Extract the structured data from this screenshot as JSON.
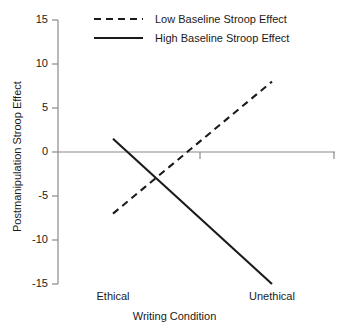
{
  "chart_data": {
    "type": "line",
    "title": "",
    "xlabel": "Writing Condition",
    "ylabel": "Postmanipulation Stroop Effect",
    "categories": [
      "Ethical",
      "Unethical"
    ],
    "x_tick_labels": [
      "Ethical",
      "Unethical"
    ],
    "y_tick_labels": [
      "15",
      "10",
      "5",
      "0",
      "-5",
      "-10",
      "-15"
    ],
    "y_ticks": [
      15,
      10,
      5,
      0,
      -5,
      -10,
      -15
    ],
    "ylim": [
      -15,
      15
    ],
    "grid": false,
    "zero_line": true,
    "legend_position": "top-center",
    "series": [
      {
        "name": "Low Baseline Stroop Effect",
        "style": "dashed",
        "color": "#1a1a1a",
        "values": [
          -7,
          8
        ]
      },
      {
        "name": "High Baseline Stroop Effect",
        "style": "solid",
        "color": "#1a1a1a",
        "values": [
          1.5,
          -15
        ]
      }
    ]
  },
  "axis": {
    "y_labels": {
      "t15": "15",
      "t10": "10",
      "t5": "5",
      "t0": "0",
      "tm5": "-5",
      "tm10": "-10",
      "tm15": "-15"
    },
    "x_labels": {
      "ethical": "Ethical",
      "unethical": "Unethical"
    },
    "x_title": "Writing Condition",
    "y_title": "Postmanipulation Stroop Effect"
  },
  "legend": {
    "entries": [
      {
        "label": "Low Baseline Stroop Effect",
        "style": "dashed"
      },
      {
        "label": "High Baseline Stroop Effect",
        "style": "solid"
      }
    ]
  },
  "colors": {
    "line": "#1a1a1a",
    "axis": "#8a8a8a",
    "background": "#ffffff"
  }
}
